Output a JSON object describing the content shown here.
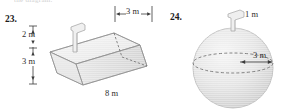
{
  "page": {
    "cutoff_text": "the diagram.",
    "background": "#ffffff",
    "ink": "#2e2e2e",
    "fill_light": "#ededed",
    "fill_mid": "#e0e0e0",
    "fill_dark": "#d2d2d2"
  },
  "figures": [
    {
      "id": "figure-23",
      "number": "23.",
      "shape": "trapezoidal-trough-prism",
      "labels": [
        {
          "name": "height-top",
          "text": "2 m"
        },
        {
          "name": "height-bottom",
          "text": "3 m"
        },
        {
          "name": "top-width",
          "text": "3 m"
        },
        {
          "name": "length",
          "text": "8 m"
        }
      ],
      "has_spout": true
    },
    {
      "id": "figure-24",
      "number": "24.",
      "shape": "sphere",
      "labels": [
        {
          "name": "spout-height",
          "text": "1 m"
        },
        {
          "name": "radius",
          "text": "3 m"
        }
      ],
      "has_spout": true,
      "has_equator_dashed": true
    }
  ]
}
